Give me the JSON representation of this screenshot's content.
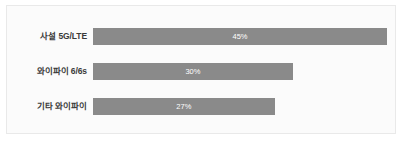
{
  "chart_data": {
    "type": "bar",
    "orientation": "horizontal",
    "title": "",
    "subtitle": "",
    "xlabel": "",
    "ylabel": "",
    "categories": [
      "사설 5G/LTE",
      "와이파이 6/6s",
      "기타 와이파이"
    ],
    "values": [
      45,
      30,
      27
    ],
    "value_labels": [
      "45%",
      "30%",
      "27%"
    ],
    "unit": "%",
    "xlim": [
      0,
      45
    ],
    "grid": false,
    "axis_visible": false,
    "legend": false,
    "legend_position": "none",
    "bars": [
      {
        "category": "사설 5G/LTE",
        "value": 45,
        "label": "45%",
        "width_pct": 100.0
      },
      {
        "category": "와이파이 6/6s",
        "value": 30,
        "label": "30%",
        "width_pct": 68.0
      },
      {
        "category": "기타 와이파이",
        "value": 27,
        "label": "27%",
        "width_pct": 61.8
      }
    ]
  },
  "colors": {
    "bar_fill": "#8a8a8a",
    "value_text": "#ffffff",
    "category_text": "#3a3a3a",
    "card_background": "#fbfbfb",
    "card_border": "#e9e9e9",
    "page_background": "#ffffff"
  }
}
